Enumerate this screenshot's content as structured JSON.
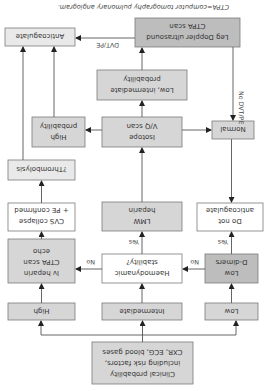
{
  "caption": "CTPA=computer tomography pulmonary angiogram.",
  "nodes": {
    "clinical": [
      "Clinical probability",
      "including risk factors,",
      "CXR, ECG, blood gases"
    ],
    "high": [
      "High"
    ],
    "intermediate": [
      "Intermediate"
    ],
    "low": [
      "Low"
    ],
    "iv_heparin": [
      "Iv heparin",
      "CTPA scan",
      "echo"
    ],
    "haemodynamic": [
      "Haemodynamic",
      "stability?"
    ],
    "low_ddimers": [
      "Low",
      "D-dimers"
    ],
    "cvs_collapse": [
      "CVS collapse",
      "+ PE confirmed"
    ],
    "lmw_heparin": [
      "LMW",
      "heparin"
    ],
    "do_not": [
      "Do not",
      "anticoagulate"
    ],
    "thrombolysis": [
      "?Thrombolysis"
    ],
    "high_prob": [
      "High",
      "probability"
    ],
    "isotope": [
      "Isotope",
      "V/Q scan"
    ],
    "normal": [
      "Normal"
    ],
    "low_int_prob": [
      "Low, intermediate",
      "probability"
    ],
    "anticoagulate": [
      "Anticoagulate"
    ],
    "leg_doppler": [
      "Leg Doppler ultrasound",
      "CTPA scan"
    ]
  },
  "edge_labels": {
    "haemo_no": "No",
    "haemo_yes": "Yes",
    "ddimer_no": "No",
    "ddimer_yes": "Yes",
    "dvt_pe": "DVT/PE",
    "no_dvt_pe": "No DVT/PE"
  },
  "colors": {
    "line": "#555555",
    "box_border": "#7a7a7a",
    "light_fill": "#e9e9e9",
    "mid_fill": "#d6d6d6",
    "dark_fill": "#bdbdbd"
  }
}
